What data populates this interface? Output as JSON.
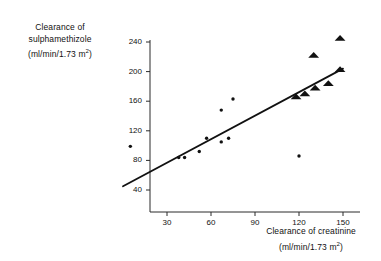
{
  "chart_data": {
    "type": "scatter",
    "title": "",
    "xlabel": "Clearance of creatinine (ml/min/1.73 m²)",
    "ylabel": "Clearance of sulphamethizole (ml/min/1.73 m²)",
    "xlim": [
      0,
      160
    ],
    "ylim": [
      30,
      255
    ],
    "grid": false,
    "legend": "none",
    "xticks": [
      30,
      60,
      90,
      120,
      150
    ],
    "ytick_labels": [
      "40",
      "80",
      "120",
      "160",
      "200",
      "240"
    ],
    "xtick_labels": [
      "30",
      "60",
      "90",
      "120",
      "150"
    ],
    "yticks": [
      40,
      80,
      120,
      160,
      200,
      240
    ],
    "series": [
      {
        "name": "circle-markers",
        "marker": "circle",
        "points": [
          {
            "x": 5,
            "y": 99
          },
          {
            "x": 38,
            "y": 84
          },
          {
            "x": 42,
            "y": 84
          },
          {
            "x": 52,
            "y": 92
          },
          {
            "x": 57,
            "y": 110
          },
          {
            "x": 67,
            "y": 105
          },
          {
            "x": 67,
            "y": 148
          },
          {
            "x": 72,
            "y": 110
          },
          {
            "x": 75,
            "y": 163
          },
          {
            "x": 120,
            "y": 86
          }
        ]
      },
      {
        "name": "triangle-markers",
        "marker": "triangle",
        "points": [
          {
            "x": 118,
            "y": 166
          },
          {
            "x": 124,
            "y": 170
          },
          {
            "x": 131,
            "y": 178
          },
          {
            "x": 140,
            "y": 184
          },
          {
            "x": 148,
            "y": 203
          },
          {
            "x": 130,
            "y": 222
          },
          {
            "x": 148,
            "y": 245
          }
        ]
      }
    ],
    "regression_line": {
      "name": "fitted-regression-line",
      "x_start": 0,
      "y_start": 45,
      "x_end": 150,
      "y_end": 204
    }
  },
  "axis_labels": {
    "y_line1": "Clearance of",
    "y_line2": "sulphamethizole",
    "y_line3_prefix": "(ml/min/1.73 m",
    "y_line3_sup": "2",
    "y_line3_suffix": ")",
    "x_line1": "Clearance of creatinine",
    "x_line2_prefix": "(ml/min/1.73 m",
    "x_line2_sup": "2",
    "x_line2_suffix": ")"
  }
}
